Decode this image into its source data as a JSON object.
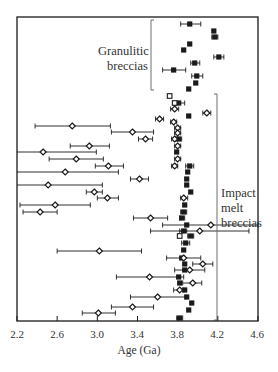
{
  "chart_data": {
    "type": "scatter",
    "title": "",
    "xlabel": "Age (Ga)",
    "ylabel": "",
    "xlim": [
      2.2,
      4.6
    ],
    "xticks": [
      "2.2",
      "2.6",
      "3.0",
      "3.4",
      "3.8",
      "4.2",
      "4.6"
    ],
    "grid": false,
    "annotations": [
      {
        "text": "Granulitic breccias",
        "lines": [
          "Granulitic",
          "breccias"
        ]
      },
      {
        "text": "Impact melt breccias",
        "lines": [
          "Impact",
          "melt",
          "breccias"
        ]
      }
    ],
    "legend": "none",
    "series": [
      {
        "name": "Granulitic breccias",
        "marker": "filled-square",
        "points": [
          {
            "y": 24,
            "age": 3.92,
            "lo": 3.83,
            "hi": 4.03
          },
          {
            "y": 31,
            "age": 4.16
          },
          {
            "y": 37,
            "age": 4.17,
            "lo": 4.14,
            "hi": 4.2
          },
          {
            "y": 44,
            "age": 3.92
          },
          {
            "y": 50,
            "age": 3.86
          },
          {
            "y": 57,
            "age": 4.21,
            "lo": 4.16,
            "hi": 4.26
          },
          {
            "y": 63,
            "age": 3.97,
            "lo": 3.93,
            "hi": 4.02
          },
          {
            "y": 70,
            "age": 3.76,
            "lo": 3.65,
            "hi": 3.88
          },
          {
            "y": 76,
            "age": 3.99,
            "lo": 3.94,
            "hi": 4.05
          },
          {
            "y": 83,
            "age": 3.98
          },
          {
            "y": 89,
            "age": 3.91
          }
        ]
      },
      {
        "name": "Impact melt breccias (filled)",
        "marker": "filled-square",
        "points": [
          {
            "y": 103,
            "age": 3.81,
            "lo": 3.76,
            "hi": 3.87
          },
          {
            "y": 116,
            "age": 3.91
          },
          {
            "y": 139,
            "age": 3.81,
            "lo": 3.78,
            "hi": 3.84
          },
          {
            "y": 152,
            "age": 3.79
          },
          {
            "y": 166,
            "age": 3.92,
            "lo": 3.88,
            "hi": 3.96
          },
          {
            "y": 172,
            "age": 3.9
          },
          {
            "y": 179,
            "age": 3.89
          },
          {
            "y": 185,
            "age": 3.89
          },
          {
            "y": 192,
            "age": 3.93
          },
          {
            "y": 205,
            "age": 3.87
          },
          {
            "y": 212,
            "age": 3.86,
            "lo": 3.83,
            "hi": 3.89
          },
          {
            "y": 218,
            "age": 3.84,
            "lo": 3.82,
            "hi": 3.87
          },
          {
            "y": 225,
            "age": 3.89
          },
          {
            "y": 231,
            "age": 3.86,
            "lo": 3.82,
            "hi": 3.89
          },
          {
            "y": 236,
            "age": 3.93,
            "lo": 3.9,
            "hi": 3.96
          },
          {
            "y": 243,
            "age": 3.88,
            "lo": 3.84,
            "hi": 3.92
          },
          {
            "y": 250,
            "age": 3.86
          },
          {
            "y": 258,
            "age": 3.84
          },
          {
            "y": 264,
            "age": 3.87
          },
          {
            "y": 270,
            "age": 3.87
          },
          {
            "y": 277,
            "age": 3.81
          },
          {
            "y": 283,
            "age": 3.82
          },
          {
            "y": 290,
            "age": 3.87
          },
          {
            "y": 297,
            "age": 3.89
          },
          {
            "y": 303,
            "age": 3.94
          },
          {
            "y": 310,
            "age": 3.91
          },
          {
            "y": 318,
            "age": 3.82,
            "lo": 3.79,
            "hi": 3.85
          }
        ]
      },
      {
        "name": "Impact melt breccias (open square)",
        "marker": "open-square",
        "points": [
          {
            "y": 96,
            "age": 3.72
          },
          {
            "y": 103,
            "age": 3.77
          },
          {
            "y": 236,
            "age": 3.82
          }
        ]
      },
      {
        "name": "Impact melt breccias (open diamond)",
        "marker": "open-diamond",
        "points": [
          {
            "y": 109,
            "age": 3.77,
            "lo": 3.73,
            "hi": 3.81
          },
          {
            "y": 113,
            "age": 4.09,
            "lo": 4.05,
            "hi": 4.13
          },
          {
            "y": 119,
            "age": 3.62,
            "lo": 3.58,
            "hi": 3.66
          },
          {
            "y": 122,
            "age": 3.76,
            "lo": 3.73,
            "hi": 3.79
          },
          {
            "y": 126,
            "age": 2.75,
            "lo": 2.38,
            "hi": 3.13
          },
          {
            "y": 128,
            "age": 3.8,
            "lo": 3.77,
            "hi": 3.83
          },
          {
            "y": 132,
            "age": 3.35,
            "lo": 3.14,
            "hi": 3.56
          },
          {
            "y": 133,
            "age": 3.8,
            "lo": 3.77,
            "hi": 3.83
          },
          {
            "y": 139,
            "age": 3.48,
            "lo": 3.41,
            "hi": 3.55
          },
          {
            "y": 139,
            "age": 3.77,
            "lo": 3.74,
            "hi": 3.8
          },
          {
            "y": 146,
            "age": 2.92,
            "lo": 2.73,
            "hi": 3.12
          },
          {
            "y": 146,
            "age": 3.8,
            "lo": 3.77,
            "hi": 3.83
          },
          {
            "y": 152,
            "age": 2.46,
            "lo": 2.18,
            "hi": 2.99
          },
          {
            "y": 159,
            "age": 2.79,
            "lo": 2.52,
            "hi": 3.06
          },
          {
            "y": 159,
            "age": 3.8,
            "lo": 3.77,
            "hi": 3.83
          },
          {
            "y": 166,
            "age": 3.11,
            "lo": 2.98,
            "hi": 3.26
          },
          {
            "y": 166,
            "age": 3.77,
            "lo": 3.74,
            "hi": 3.8
          },
          {
            "y": 172,
            "age": 2.68,
            "lo": 2.16,
            "hi": 3.21
          },
          {
            "y": 179,
            "age": 3.42,
            "lo": 3.33,
            "hi": 3.51
          },
          {
            "y": 185,
            "age": 2.51,
            "lo": 2.18,
            "hi": 3.05
          },
          {
            "y": 192,
            "age": 2.97,
            "lo": 2.89,
            "hi": 3.05
          },
          {
            "y": 198,
            "age": 3.1,
            "lo": 3.0,
            "hi": 3.21
          },
          {
            "y": 198,
            "age": 3.86,
            "lo": 3.83,
            "hi": 3.9
          },
          {
            "y": 205,
            "age": 2.58,
            "lo": 2.23,
            "hi": 2.93
          },
          {
            "y": 212,
            "age": 2.43,
            "lo": 2.26,
            "hi": 2.6
          },
          {
            "y": 218,
            "age": 3.53,
            "lo": 3.36,
            "hi": 3.7
          },
          {
            "y": 225,
            "age": 4.13,
            "lo": 3.65,
            "hi": 4.6
          },
          {
            "y": 231,
            "age": 4.02,
            "lo": 3.53,
            "hi": 4.51
          },
          {
            "y": 251,
            "age": 3.02,
            "lo": 2.6,
            "hi": 3.44
          },
          {
            "y": 258,
            "age": 3.86,
            "lo": 3.69,
            "hi": 4.03
          },
          {
            "y": 264,
            "age": 4.05,
            "lo": 3.95,
            "hi": 4.15
          },
          {
            "y": 270,
            "age": 3.92,
            "lo": 3.77,
            "hi": 4.07
          },
          {
            "y": 277,
            "age": 3.52,
            "lo": 3.19,
            "hi": 3.86
          },
          {
            "y": 283,
            "age": 3.95,
            "lo": 3.85,
            "hi": 4.04
          },
          {
            "y": 290,
            "age": 3.82,
            "lo": 3.76,
            "hi": 3.86
          },
          {
            "y": 297,
            "age": 3.6,
            "lo": 3.33,
            "hi": 3.88
          },
          {
            "y": 307,
            "age": 3.35,
            "lo": 3.14,
            "hi": 3.56
          },
          {
            "y": 313,
            "age": 3.01,
            "lo": 2.85,
            "hi": 3.18
          }
        ]
      }
    ]
  },
  "labels": {
    "granulitic_line1": "Granulitic",
    "granulitic_line2": "breccias",
    "impact_line1": "Impact",
    "impact_line2": "melt",
    "impact_line3": "breccias",
    "xlabel": "Age (Ga)",
    "ticks": [
      "2.2",
      "2.6",
      "3.0",
      "3.4",
      "3.8",
      "4.2",
      "4.6"
    ]
  },
  "colors": {
    "axis": "#1a1a1a",
    "marker": "#1a1a1a",
    "bracket": "#6e6e6e"
  }
}
